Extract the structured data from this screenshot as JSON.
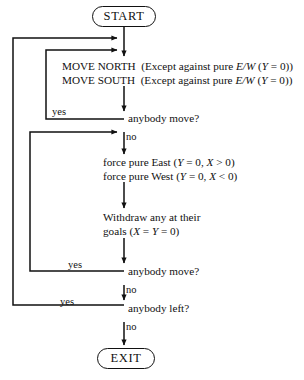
{
  "diagram": {
    "stroke_color": "#111111",
    "background_color": "#ffffff",
    "terminals": {
      "start": "START",
      "exit": "EXIT"
    },
    "processes": {
      "move": {
        "line1": "MOVE NORTH  (Except against pure E/W (Y = 0))",
        "line1_parts": {
          "action": "MOVE NORTH",
          "condition_prefix": "(Except against pure ",
          "condition_italic": "E/W",
          "condition_mid": " (",
          "var_italic": "Y",
          "condition_suffix": " = 0))"
        },
        "line2": "MOVE SOUTH  (Except against pure E/W (Y = 0))",
        "line2_parts": {
          "action": "MOVE SOUTH",
          "condition_prefix": "(Except against pure ",
          "condition_italic": "E/W",
          "condition_mid": " (",
          "var_italic": "Y",
          "condition_suffix": " = 0))"
        }
      },
      "force": {
        "line1": "force pure East (Y = 0, X > 0)",
        "line1_parts": {
          "text_prefix": "force pure East (",
          "var1": "Y",
          "mid": " = 0, ",
          "var2": "X",
          "suffix": " > 0)"
        },
        "line2": "force pure West (Y = 0, X < 0)",
        "line2_parts": {
          "text_prefix": "force pure West (",
          "var1": "Y",
          "mid": " = 0, ",
          "var2": "X",
          "suffix": " < 0)"
        }
      },
      "withdraw": {
        "line1": "Withdraw any at their",
        "line2": "goals (X = Y = 0)",
        "line2_parts": {
          "text_prefix": "goals (",
          "var1": "X",
          "mid": " = ",
          "var2": "Y",
          "suffix": " = 0)"
        }
      }
    },
    "decisions": {
      "anybody_move_1": "anybody move?",
      "anybody_move_2": "anybody move?",
      "anybody_left": "anybody left?"
    },
    "edge_labels": {
      "yes_1": "yes",
      "no_1": "no",
      "yes_2": "yes",
      "no_2": "no",
      "yes_3": "yes",
      "no_3": "no"
    }
  }
}
